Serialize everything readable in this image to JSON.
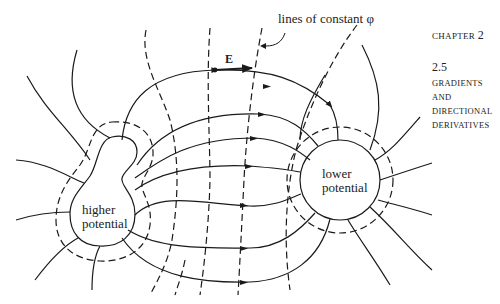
{
  "margin": {
    "chapter_word": "CHAPTER",
    "chapter_num": "2",
    "section_num": "2.5",
    "section_title_lines": [
      "GRADIENTS",
      "AND",
      "DIRECTIONAL",
      "DERIVATIVES"
    ]
  },
  "figure": {
    "annotation": "lines of constant φ",
    "vector_label": "E",
    "left_region_label": [
      "higher",
      "potential"
    ],
    "right_region_label": [
      "lower",
      "potential"
    ],
    "stroke_color": "#1a1a1a",
    "background": "#ffffff"
  }
}
